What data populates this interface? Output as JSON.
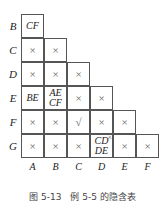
{
  "rows": [
    "B",
    "C",
    "D",
    "E",
    "F",
    "G"
  ],
  "cols": [
    "A",
    "B",
    "C",
    "D",
    "E",
    "F"
  ],
  "cells": [
    [
      "CF"
    ],
    [
      "×",
      "×"
    ],
    [
      "×",
      "×",
      "×"
    ],
    [
      "BE",
      "AE CF",
      "×",
      "×"
    ],
    [
      "×",
      "×",
      "√",
      "×",
      "×"
    ],
    [
      "×",
      "×",
      "×",
      "CD DE",
      "×",
      "×"
    ]
  ],
  "extra_mark": "×",
  "caption": "图 5-13　例 5-5 的隐含表"
}
